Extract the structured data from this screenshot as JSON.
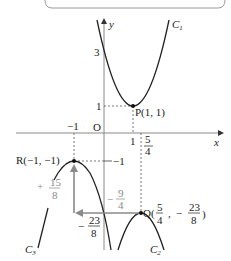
{
  "diagram": {
    "axes": {
      "x_label": "x",
      "y_label": "y",
      "origin_label": "O"
    },
    "curves": [
      {
        "name": "C1",
        "label": "C",
        "sub": "1",
        "type": "parabola-up",
        "vertex": "P(1, 1)",
        "y_intercept": "3"
      },
      {
        "name": "C2",
        "label": "C",
        "sub": "2",
        "type": "parabola-down",
        "vertex": "Q(5/4, -23/8)"
      },
      {
        "name": "C3",
        "label": "C",
        "sub": "3",
        "type": "parabola-down",
        "vertex": "R(-1, -1)"
      }
    ],
    "points": {
      "P": {
        "label": "P(1,  1)"
      },
      "R": {
        "label": "R(−1,  −1)"
      },
      "Q": {
        "prefix": "Q(",
        "x_num": "5",
        "x_den": "4",
        "sep": ",",
        "y_sign": "−",
        "y_num": "23",
        "y_den": "8",
        "suffix": ")"
      }
    },
    "ticks": {
      "y3": "3",
      "y1": "1",
      "xm1": "−1",
      "x1": "1",
      "x54_num": "5",
      "x54_den": "4",
      "ym1": "−1"
    },
    "translation": {
      "vertical": {
        "sign": "+",
        "num": "15",
        "den": "8"
      },
      "horizontal": {
        "sign": "−",
        "num": "9",
        "den": "4"
      },
      "shift_y": {
        "sign": "−",
        "num": "23",
        "den": "8"
      }
    },
    "colors": {
      "curve": "#222222",
      "arrow": "#8a8a8a",
      "guide": "#555555"
    }
  }
}
